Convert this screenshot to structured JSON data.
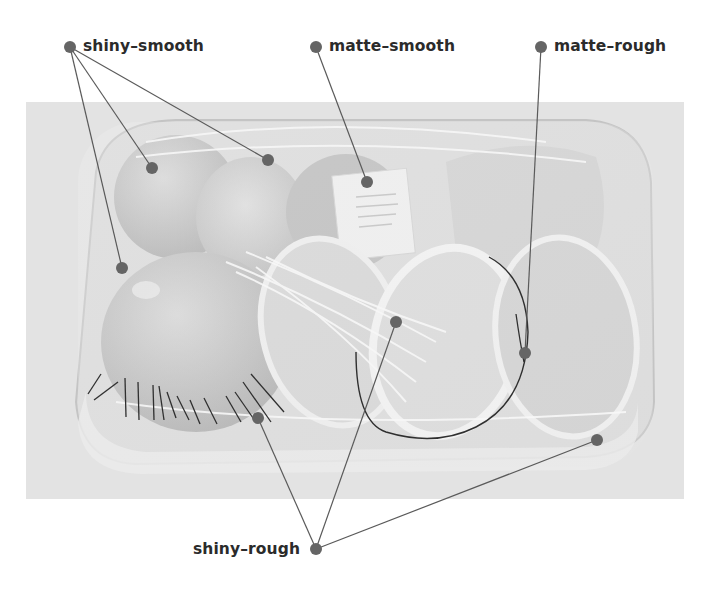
{
  "figure": {
    "type": "annotated-photo",
    "colors": {
      "background": "#ffffff",
      "photo_backdrop": "#e4e4e4",
      "marker": "#6b6b6b",
      "leader_line": "#5a5a5a",
      "label_text": "#2b2b2b"
    }
  },
  "labels": {
    "shiny_smooth": "shiny–smooth",
    "matte_smooth": "matte–smooth",
    "matte_rough": "matte–rough",
    "shiny_rough": "shiny–rough"
  },
  "annotations": [
    {
      "label": "shiny–smooth",
      "anchor": [
        70,
        47
      ],
      "targets": [
        [
          152,
          168
        ],
        [
          268,
          160
        ],
        [
          122,
          268
        ]
      ]
    },
    {
      "label": "matte–smooth",
      "anchor": [
        316,
        47
      ],
      "targets": [
        [
          367,
          182
        ]
      ]
    },
    {
      "label": "matte–rough",
      "anchor": [
        541,
        47
      ],
      "targets": [
        [
          525,
          353
        ]
      ]
    },
    {
      "label": "shiny–rough",
      "anchor": [
        316,
        549
      ],
      "targets": [
        [
          258,
          418
        ],
        [
          396,
          322
        ],
        [
          597,
          440
        ]
      ]
    }
  ]
}
